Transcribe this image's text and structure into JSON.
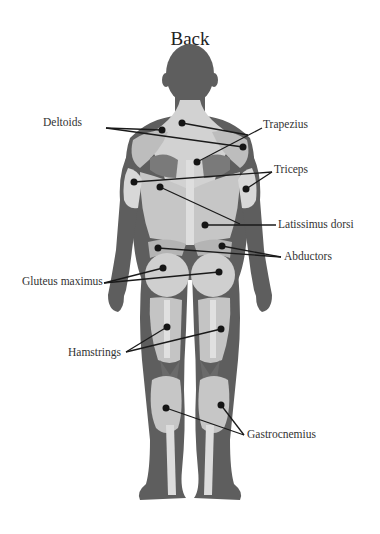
{
  "title": "Back",
  "colors": {
    "skin_dark": "#5e5e5e",
    "muscle_light": "#c9c9c9",
    "muscle_mid": "#a9a9a9",
    "tendon": "#e3e3e3",
    "leader_line": "#1a1a1a",
    "dot": "#151515",
    "text": "#333333"
  },
  "labels": {
    "deltoids": "Deltoids",
    "trapezius": "Trapezius",
    "triceps": "Triceps",
    "latissimus_dorsi": "Latissimus dorsi",
    "abductors": "Abductors",
    "gluteus_maximus": "Gluteus maximus",
    "hamstrings": "Hamstrings",
    "gastrocnemius": "Gastrocnemius"
  }
}
